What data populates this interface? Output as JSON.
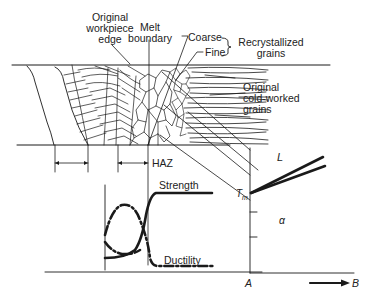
{
  "diagram": {
    "labels": {
      "original_edge_l1": "Original",
      "original_edge_l2": "workpiece",
      "original_edge_l3": "edge",
      "melt_l1": "Melt",
      "melt_l2": "boundary",
      "coarse": "Coarse",
      "fine": "Fine",
      "recryst_l1": "Recrystallized",
      "recryst_l2": "grains",
      "cold_l1": "Original",
      "cold_l2": "cold-worked",
      "cold_l3": "grains",
      "haz": "HAZ",
      "strength": "Strength",
      "ductility": "Ductility",
      "liquid": "L",
      "tm": "T",
      "tm_sub": "m",
      "alpha": "α",
      "axis_a": "A",
      "axis_b": "B"
    },
    "legend": {
      "strength_line": "solid",
      "ductility_line": "dash-dot"
    },
    "colors": {
      "ink": "#1a1a1a",
      "background": "#ffffff"
    }
  }
}
